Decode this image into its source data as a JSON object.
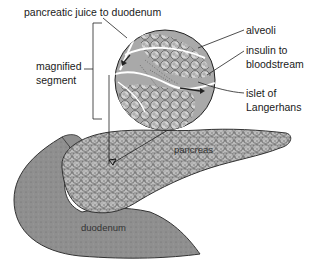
{
  "diagram": {
    "title": "",
    "colors": {
      "background": "#ffffff",
      "duodenum_fill": "#8f8f8f",
      "pancreas_fill": "#bdbdbd",
      "circle_fill": "#a9a9a9",
      "alveoli_fill": "#d8d8d8",
      "line": "#222222",
      "duct": "#ffffff"
    },
    "labels": {
      "pancreatic_juice": "pancreatic juice to duodenum",
      "magnified_segment_line1": "magnified",
      "magnified_segment_line2": "segment",
      "alveoli": "alveoli",
      "insulin_line1": "insulin to",
      "insulin_line2": "bloodstream",
      "islet_line1": "islet of",
      "islet_line2": "Langerhans",
      "pancreas": "pancreas",
      "duodenum": "duodenum"
    },
    "structures": [
      {
        "name": "duodenum",
        "label": "duodenum"
      },
      {
        "name": "pancreas",
        "label": "pancreas"
      },
      {
        "name": "magnified-segment",
        "label": "magnified segment"
      },
      {
        "name": "alveoli",
        "label": "alveoli"
      },
      {
        "name": "islet-of-langerhans",
        "label": "islet of Langerhans"
      },
      {
        "name": "pancreatic-duct",
        "label": "pancreatic juice to duodenum"
      },
      {
        "name": "blood-vessel",
        "label": "insulin to bloodstream"
      }
    ]
  }
}
